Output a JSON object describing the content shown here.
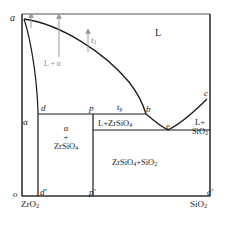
{
  "figure": {
    "type": "binary-phase-diagram",
    "system": "ZrO2-SiO2"
  },
  "axis_endpoints": {
    "origin": "o",
    "left_top": "a",
    "right_bottom": "c′",
    "right_top_point": "c"
  },
  "points": [
    {
      "id": "a",
      "label": "a",
      "x": 22,
      "y": 20
    },
    {
      "id": "d",
      "label": "d",
      "x": 44,
      "y": 114
    },
    {
      "id": "p",
      "label": "p",
      "x": 93,
      "y": 114
    },
    {
      "id": "b",
      "label": "b",
      "x": 146,
      "y": 114
    },
    {
      "id": "e",
      "label": "e",
      "x": 168,
      "y": 130
    },
    {
      "id": "c",
      "label": "c",
      "x": 206,
      "y": 99
    },
    {
      "id": "o",
      "label": "o",
      "x": 17,
      "y": 198
    },
    {
      "id": "dp",
      "label": "d′",
      "x": 44,
      "y": 198
    },
    {
      "id": "pp",
      "label": "p′",
      "x": 93,
      "y": 198
    },
    {
      "id": "cp",
      "label": "c′",
      "x": 210,
      "y": 198
    }
  ],
  "axis_labels": {
    "left_component": "ZrO",
    "left_component_sub": "2",
    "right_component": "SiO",
    "right_component_sub": "2"
  },
  "regions": {
    "liquid": "L",
    "liquid_alpha": "L + α",
    "alpha": "α",
    "alpha_zircon_line1": "α",
    "alpha_zircon_plus": "+",
    "alpha_zircon_line3": "ZrSiO",
    "alpha_zircon_sub": "4",
    "liquid_zircon": "L+ZrSiO",
    "liquid_zircon_sub": "4",
    "liquid_silica_line1": "L+",
    "liquid_silica_line2": "SiO",
    "liquid_silica_sub": "2",
    "zircon_silica": "ZrSiO",
    "zircon_silica_sub1": "4",
    "zircon_silica_mid": "+SiO",
    "zircon_silica_sub2": "2"
  },
  "annotations": {
    "t1_label": "t",
    "t1_sub": "1",
    "tp_label": "t",
    "tp_sub": "p"
  },
  "colors": {
    "line": "#1a1a1a",
    "frame": "#4d4d4d",
    "arrow": "#8c8c8c",
    "faint_text": "#8a8a8a",
    "background": "#ffffff"
  },
  "geometry": {
    "frame": {
      "left": 22,
      "top": 14,
      "right": 210,
      "bottom": 196
    },
    "peritectic_line_y": 114,
    "eutectic_line_y": 130,
    "alpha_boundary_bottom_x": 38,
    "zircon_vertical_x": 93
  }
}
